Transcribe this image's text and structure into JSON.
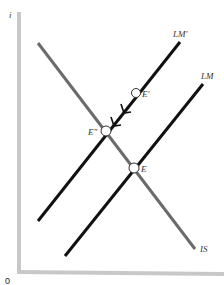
{
  "diagram": {
    "type": "IS-LM",
    "axes": {
      "y_label": "i",
      "origin_label": "0",
      "x_label": ""
    },
    "curves": [
      {
        "id": "IS",
        "label": "IS",
        "color": "#6b6b6b"
      },
      {
        "id": "LM",
        "label": "LM",
        "color": "#111111"
      },
      {
        "id": "LM_prime",
        "label": "LM′",
        "color": "#111111"
      }
    ],
    "points": [
      {
        "id": "E",
        "label": "E"
      },
      {
        "id": "E_prime",
        "label": "E′"
      },
      {
        "id": "E_double_prime",
        "label": "E″"
      }
    ],
    "arrows": [
      {
        "from": "E_prime",
        "to": "E_double_prime",
        "along": "LM_prime"
      }
    ],
    "colors": {
      "axis": "#c8c8c8",
      "is_curve": "#6b6b6b",
      "lm_curve": "#111111"
    }
  }
}
